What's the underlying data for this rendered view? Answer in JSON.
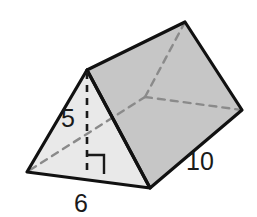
{
  "figure": {
    "kind": "triangular-prism",
    "background_color": "#ffffff",
    "colors": {
      "front_face_fill": "#e9e9e9",
      "top_face_fill": "#c6c6c6",
      "outline": "#111111",
      "hidden_edge": "#8a8a8a",
      "label_text": "#1a1a1a"
    },
    "stroke": {
      "outline_width": 3.2,
      "hidden_width": 2.4,
      "hidden_dash": "7 6",
      "altitude_dash": "7 6",
      "right_angle_width": 2.4
    },
    "vertices": {
      "front_left": {
        "x": 27,
        "y": 172
      },
      "front_apex": {
        "x": 87,
        "y": 70
      },
      "front_right": {
        "x": 150,
        "y": 188
      },
      "back_apex": {
        "x": 185,
        "y": 22
      },
      "back_right": {
        "x": 242,
        "y": 110
      },
      "back_hidden": {
        "x": 145,
        "y": 97
      },
      "altitude_foot": {
        "x": 87,
        "y": 172
      }
    },
    "faces": [
      {
        "name": "front-triangle-face",
        "fill": "#e9e9e9",
        "points": "27,172 87,70 150,188"
      },
      {
        "name": "top-rectangle-face",
        "fill": "#c6c6c6",
        "points": "87,70 185,22 242,110 150,188"
      }
    ],
    "hidden_edges": [
      {
        "name": "hidden-edge-left-base",
        "x1": 30,
        "y1": 170,
        "x2": 145,
        "y2": 97
      },
      {
        "name": "hidden-edge-to-back-apex",
        "x1": 145,
        "y1": 97,
        "x2": 185,
        "y2": 22
      },
      {
        "name": "hidden-edge-to-back-right",
        "x1": 145,
        "y1": 97,
        "x2": 242,
        "y2": 110
      }
    ],
    "altitude": {
      "name": "altitude-segment",
      "x1": 87,
      "y1": 72,
      "x2": 87,
      "y2": 173
    },
    "right_angle_marker": {
      "name": "right-angle-marker",
      "points": "87,155 104,155 104,174"
    }
  },
  "labels": {
    "height": {
      "text": "5",
      "x": 68,
      "y": 127,
      "font_size": 25
    },
    "base": {
      "text": "6",
      "x": 81,
      "y": 212,
      "font_size": 25
    },
    "length": {
      "text": "10",
      "x": 200,
      "y": 170,
      "font_size": 25
    }
  }
}
